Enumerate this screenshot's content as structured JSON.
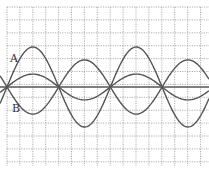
{
  "figure": {
    "labels": {
      "A": "A",
      "B": "B"
    },
    "colors": {
      "background": "#ffffff",
      "grid": "#9a9a9a",
      "curve": "#555555",
      "text": "#333333"
    },
    "grid": {
      "x_start": 7,
      "x_end": 209,
      "y_start": 7,
      "y_end": 166,
      "spacing": 12.9,
      "style": "dotted"
    },
    "axis": {
      "y": 87,
      "x_start": 0,
      "x_end": 209
    },
    "nodes_x": [
      7,
      59,
      110,
      162
    ],
    "half_wavelength_px": 51.7
  },
  "chart_data": {
    "type": "line",
    "title": "",
    "xlabel": "",
    "ylabel": "",
    "grid": true,
    "x_units": "grid squares",
    "y_units": "grid squares (positive up)",
    "nodes_x": [
      0,
      4,
      8,
      12
    ],
    "series": [
      {
        "name": "A",
        "amplitude": 3.1,
        "phase": "sin",
        "label_pos": [
          0.5,
          2.0
        ]
      },
      {
        "name": "B",
        "amplitude": 2.1,
        "phase": "-sin",
        "label_pos": [
          0.6,
          -1.6
        ]
      },
      {
        "name": "resultant",
        "amplitude": 1.0,
        "phase": "sin"
      },
      {
        "name": "equilibrium",
        "amplitude": 0,
        "phase": "flat"
      }
    ],
    "wavelength_squares": 8,
    "xlim": [
      -0.5,
      15.5
    ],
    "ylim": [
      -6.2,
      6.2
    ]
  }
}
